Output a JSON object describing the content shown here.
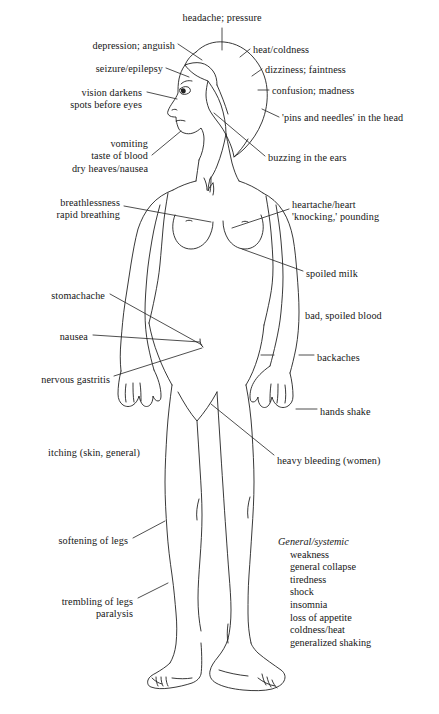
{
  "figure": {
    "kind": "anatomical-symptom-diagram",
    "line_color": "#222222",
    "background_color": "#ffffff",
    "text_color": "#161616"
  },
  "callouts": [
    {
      "id": "headache",
      "text": "headache; pressure",
      "align": "center",
      "x": 222,
      "y": 12,
      "leader": true
    },
    {
      "id": "depression",
      "text": "depression; anguish",
      "align": "right",
      "x": 175,
      "y": 40,
      "leader": true
    },
    {
      "id": "seizure",
      "text": "seizure/epilepsy",
      "align": "right",
      "x": 163,
      "y": 63,
      "leader": true
    },
    {
      "id": "vision",
      "text": "vision darkens\nspots before eyes",
      "align": "right",
      "x": 142,
      "y": 87,
      "leader": true
    },
    {
      "id": "vomiting",
      "text": "vomiting\ntaste of blood\ndry heaves/nausea",
      "align": "right",
      "x": 148,
      "y": 138,
      "leader": true
    },
    {
      "id": "breathlessness",
      "text": "breathlessness\nrapid breathing",
      "align": "right",
      "x": 120,
      "y": 197,
      "leader": true
    },
    {
      "id": "stomachache",
      "text": "stomachache",
      "align": "right",
      "x": 105,
      "y": 290,
      "leader": true
    },
    {
      "id": "nausea",
      "text": "nausea",
      "align": "right",
      "x": 88,
      "y": 331,
      "leader": true
    },
    {
      "id": "nervous-gastritis",
      "text": "nervous gastritis",
      "align": "right",
      "x": 110,
      "y": 374,
      "leader": true
    },
    {
      "id": "itching",
      "text": "itching (skin, general)",
      "align": "right",
      "x": 140,
      "y": 447,
      "leader": false
    },
    {
      "id": "softening-legs",
      "text": "softening of legs",
      "align": "right",
      "x": 128,
      "y": 535,
      "leader": true
    },
    {
      "id": "trembling-legs",
      "text": "trembling of legs\nparalysis",
      "align": "right",
      "x": 133,
      "y": 596,
      "leader": true
    },
    {
      "id": "heat-coldness",
      "text": "heat/coldness",
      "align": "left",
      "x": 253,
      "y": 44,
      "leader": true
    },
    {
      "id": "dizziness",
      "text": "dizziness; faintness",
      "align": "left",
      "x": 265,
      "y": 64,
      "leader": true
    },
    {
      "id": "confusion",
      "text": "confusion; madness",
      "align": "left",
      "x": 272,
      "y": 85,
      "leader": true
    },
    {
      "id": "pins-needles",
      "text": "'pins and needles' in the head",
      "align": "left",
      "x": 282,
      "y": 112,
      "leader": true
    },
    {
      "id": "buzzing-ears",
      "text": "buzzing in the ears",
      "align": "left",
      "x": 268,
      "y": 152,
      "leader": true
    },
    {
      "id": "heartache",
      "text": "heartache/heart\n'knocking,' pounding",
      "align": "left",
      "x": 292,
      "y": 199,
      "leader": true
    },
    {
      "id": "spoiled-milk",
      "text": "spoiled milk",
      "align": "left",
      "x": 306,
      "y": 268,
      "leader": true
    },
    {
      "id": "spoiled-blood",
      "text": "bad, spoiled blood",
      "align": "left",
      "x": 305,
      "y": 310,
      "leader": false
    },
    {
      "id": "backaches",
      "text": "backaches",
      "align": "left",
      "x": 317,
      "y": 352,
      "leader": true
    },
    {
      "id": "hands-shake",
      "text": "hands shake",
      "align": "left",
      "x": 320,
      "y": 406,
      "leader": true
    },
    {
      "id": "heavy-bleeding",
      "text": "heavy bleeding (women)",
      "align": "left",
      "x": 277,
      "y": 455,
      "leader": true
    }
  ],
  "systemic": {
    "heading": "General/systemic",
    "items": [
      "weakness",
      "general collapse",
      "tiredness",
      "shock",
      "insomnia",
      "loss of appetite",
      "coldness/heat",
      "generalized shaking"
    ]
  }
}
